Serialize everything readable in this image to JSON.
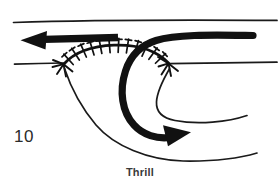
{
  "figure": {
    "number_label": "10",
    "caption": "Thrill",
    "background_color": "#ffffff",
    "ink_color": "#111111",
    "width": 280,
    "height": 188
  },
  "diagram": {
    "title": "Thrill",
    "elements": [
      {
        "name": "upper-vessel-wall-top",
        "role": "thin-boundary-line",
        "description": "Upper horizontal vessel wall across the top of the figure"
      },
      {
        "name": "upper-vessel-wall-bottom",
        "role": "thin-boundary-line",
        "description": "Lower horizontal wall of the upper vessel, interrupted by the anastomosis arc"
      },
      {
        "name": "suture-arc",
        "role": "hatched-anastomosis",
        "description": "Arched suture line with cross-hatch stitch marks joining graft to vessel"
      },
      {
        "name": "proximal-flow-arrow",
        "role": "thick-flow-arrow",
        "direction": "left",
        "description": "Heavy arrow showing flow travelling leftwards along the upper vessel"
      },
      {
        "name": "graft-flow-arrow",
        "role": "thick-flow-arrow",
        "direction": "right-down",
        "description": "Heavy curved arrow showing flow entering the graft and turning rightwards"
      },
      {
        "name": "graft-outer-wall",
        "role": "thin-graft-outline",
        "description": "Outer thin wall of the graft curving down and to the right"
      },
      {
        "name": "graft-inner-wall",
        "role": "thin-graft-outline",
        "description": "Inner thin wall of the graft curving down and to the right"
      }
    ],
    "colors": {
      "line": "#111111",
      "arrow": "#111111",
      "paper": "#ffffff",
      "text": "#2b2b2b"
    },
    "stroke_widths": {
      "thin_line": 1.4,
      "suture_line": 2.6,
      "stitch_tick": 1.6,
      "thick_arrow": 7
    }
  }
}
